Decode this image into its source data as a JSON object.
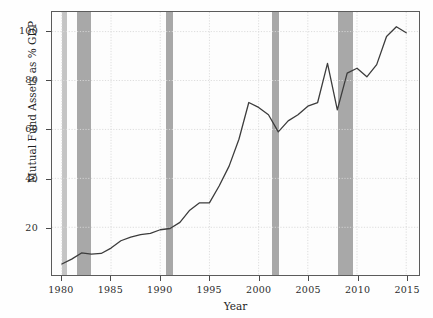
{
  "chart_data": {
    "type": "line",
    "title": "",
    "xlabel": "Year",
    "ylabel": "Mutual Fund Assets as % GDP",
    "xlim": [
      1979.0,
      2016.3
    ],
    "ylim": [
      0.5,
      108.0
    ],
    "xticks": [
      1980,
      1985,
      1990,
      1995,
      2000,
      2005,
      2010,
      2015
    ],
    "xticklabels": [
      "1980",
      "1985",
      "1990",
      "1995",
      "2000",
      "2005",
      "2010",
      "2015"
    ],
    "yticks": [
      20,
      40,
      60,
      80,
      100
    ],
    "yticklabels": [
      "20",
      "40",
      "60",
      "80",
      "100"
    ],
    "grid": true,
    "grid_style": "dotted",
    "grid_color": "#d9d9d9",
    "legend": null,
    "line_color": "#3c3c3c",
    "line_width": 1.3,
    "x": [
      1980,
      1981,
      1982,
      1983,
      1984,
      1985,
      1986,
      1987,
      1988,
      1989,
      1990,
      1991,
      1992,
      1993,
      1994,
      1995,
      1996,
      1997,
      1998,
      1999,
      2000,
      2001,
      2002,
      2003,
      2004,
      2005,
      2006,
      2007,
      2008,
      2009,
      2010,
      2011,
      2012,
      2013,
      2014,
      2015
    ],
    "values": [
      5.0,
      7.0,
      9.5,
      9.0,
      9.3,
      11.5,
      14.5,
      16.0,
      17.0,
      17.5,
      19.0,
      19.5,
      22.0,
      27.0,
      30.0,
      30.0,
      37.0,
      45.0,
      56.0,
      71.0,
      69.0,
      66.0,
      59.0,
      63.5,
      66.0,
      69.5,
      71.0,
      87.0,
      68.0,
      83.0,
      85.0,
      81.5,
      86.5,
      98.0,
      102.0,
      99.5
    ]
  },
  "recession_bands": [
    {
      "label": "1980 recession",
      "start": 1980.0,
      "end": 1980.55,
      "shade": "light"
    },
    {
      "label": "1981-1982 recession",
      "start": 1981.5,
      "end": 1982.9,
      "shade": "dark"
    },
    {
      "label": "1990-1991 recession",
      "start": 1990.55,
      "end": 1991.2,
      "shade": "dark"
    },
    {
      "label": "2001 recession",
      "start": 2001.2,
      "end": 2001.9,
      "shade": "dark"
    },
    {
      "label": "2007-2009 recession",
      "start": 2007.9,
      "end": 2009.4,
      "shade": "dark"
    }
  ]
}
